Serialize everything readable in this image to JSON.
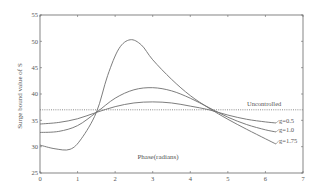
{
  "chart_data": {
    "type": "line",
    "title": "",
    "xlabel": "Phase(radians)",
    "ylabel": "Surge bound value of S",
    "xlim": [
      0,
      7
    ],
    "ylim": [
      25,
      55
    ],
    "xticks": [
      0,
      1,
      2,
      3,
      4,
      5,
      6,
      7
    ],
    "yticks": [
      25,
      30,
      35,
      40,
      45,
      50,
      55
    ],
    "grid": false,
    "legend": "inline labels at right end of curves",
    "series": [
      {
        "name": "Uncontrolled",
        "style": "dotted",
        "x": [
          0,
          7
        ],
        "y": [
          37,
          37
        ]
      },
      {
        "name": "g=0.5",
        "style": "solid",
        "x": [
          0,
          0.5,
          1.0,
          1.5,
          2.0,
          2.5,
          3.0,
          3.5,
          4.0,
          4.5,
          5.0,
          5.5,
          6.0,
          6.28
        ],
        "y": [
          34.3,
          34.6,
          35.3,
          36.5,
          37.6,
          38.3,
          38.5,
          38.3,
          37.7,
          37.0,
          36.0,
          35.2,
          34.7,
          34.5
        ]
      },
      {
        "name": "g=1.0",
        "style": "solid",
        "x": [
          0,
          0.5,
          1.0,
          1.5,
          2.0,
          2.5,
          3.0,
          3.5,
          4.0,
          4.5,
          5.0,
          5.5,
          6.0,
          6.28
        ],
        "y": [
          32.7,
          32.9,
          34.0,
          36.5,
          39.2,
          40.8,
          41.2,
          40.6,
          39.2,
          37.4,
          35.6,
          34.2,
          33.2,
          32.8
        ]
      },
      {
        "name": "g=1.75",
        "style": "solid",
        "x": [
          0,
          0.4,
          0.8,
          1.1,
          1.5,
          1.8,
          2.1,
          2.4,
          2.7,
          3.0,
          3.5,
          4.0,
          4.5,
          5.0,
          5.5,
          6.0,
          6.28
        ],
        "y": [
          30.3,
          29.6,
          29.5,
          31.5,
          36.5,
          43.5,
          48.6,
          50.3,
          49.3,
          46.5,
          42.8,
          39.7,
          37.3,
          35.2,
          33.3,
          31.5,
          30.5
        ]
      }
    ],
    "annotations": [
      {
        "text": "Uncontrolled",
        "x": 5.6,
        "y": 37.5
      },
      {
        "text": "g=0.5",
        "x": 6.35,
        "y": 34.5
      },
      {
        "text": "g=1.0",
        "x": 6.35,
        "y": 32.8
      },
      {
        "text": "g=1.75",
        "x": 6.35,
        "y": 30.5
      }
    ]
  },
  "labels": {
    "xlabel": "Phase(radians)",
    "ylabel": "Surge bound value of S",
    "uncontrolled": "Uncontrolled",
    "g05": "g=0.5",
    "g10": "g=1.0",
    "g175": "g=1.75"
  },
  "colors": {
    "axis": "#666666",
    "line": "#6e6e6e",
    "text": "#555555"
  }
}
